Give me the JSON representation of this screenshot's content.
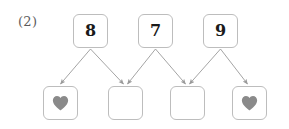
{
  "problem": {
    "label": "(2)",
    "type": "number-bond-worksheet"
  },
  "top_row": {
    "name": "addend-row",
    "cells": [
      {
        "id": "top-1",
        "value": "8",
        "x": 73,
        "y": 14
      },
      {
        "id": "top-2",
        "value": "7",
        "x": 138,
        "y": 14
      },
      {
        "id": "top-3",
        "value": "9",
        "x": 203,
        "y": 14
      }
    ]
  },
  "bottom_row": {
    "name": "answer-row",
    "cells": [
      {
        "id": "bottom-1",
        "value": "",
        "icon": "heart-icon",
        "x": 43,
        "y": 86
      },
      {
        "id": "bottom-2",
        "value": "",
        "icon": "",
        "x": 108,
        "y": 86
      },
      {
        "id": "bottom-3",
        "value": "",
        "icon": "",
        "x": 170,
        "y": 86
      },
      {
        "id": "bottom-4",
        "value": "",
        "icon": "heart-icon",
        "x": 232,
        "y": 86
      }
    ]
  },
  "arrows": [
    {
      "from": "top-1",
      "to": "bottom-1",
      "x1": 90.5,
      "y1": 49,
      "x2": 60.5,
      "y2": 84
    },
    {
      "from": "top-1",
      "to": "bottom-2",
      "x1": 90.5,
      "y1": 49,
      "x2": 123.5,
      "y2": 84
    },
    {
      "from": "top-2",
      "to": "bottom-2",
      "x1": 155.5,
      "y1": 49,
      "x2": 127.5,
      "y2": 84
    },
    {
      "from": "top-2",
      "to": "bottom-3",
      "x1": 155.5,
      "y1": 49,
      "x2": 185.5,
      "y2": 84
    },
    {
      "from": "top-3",
      "to": "bottom-3",
      "x1": 220.5,
      "y1": 49,
      "x2": 189.5,
      "y2": 84
    },
    {
      "from": "top-3",
      "to": "bottom-4",
      "x1": 220.5,
      "y1": 49,
      "x2": 247.5,
      "y2": 84
    }
  ],
  "colors": {
    "box_border": "#bdbdbd",
    "box_fill": "#ffffff",
    "digit": "#1a1a1a",
    "heart": "#8a8a8a",
    "arrow": "#9a9a9a",
    "label": "#5b5b5b",
    "page_background": "#ffffff"
  }
}
